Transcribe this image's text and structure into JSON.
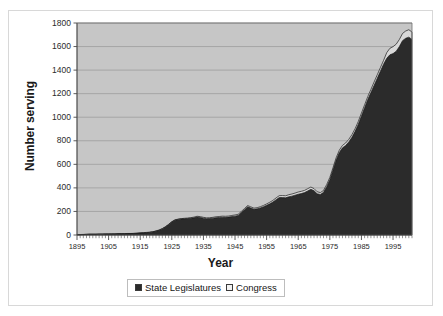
{
  "chart_data": {
    "type": "area",
    "title": "",
    "xlabel": "Year",
    "ylabel": "Number serving",
    "xlim": [
      1895,
      2001
    ],
    "ylim": [
      0,
      1800
    ],
    "ytick_labels": [
      "0",
      "200",
      "400",
      "600",
      "800",
      "1000",
      "1200",
      "1400",
      "1600",
      "1800"
    ],
    "ytick_values": [
      0,
      200,
      400,
      600,
      800,
      1000,
      1200,
      1400,
      1600,
      1800
    ],
    "xtick_labels": [
      "1895",
      "1905",
      "1915",
      "1925",
      "1935",
      "1945",
      "1955",
      "1965",
      "1975",
      "1985",
      "1995"
    ],
    "xtick_values": [
      1895,
      1905,
      1915,
      1925,
      1935,
      1945,
      1955,
      1965,
      1975,
      1985,
      1995
    ],
    "grid": "horizontal",
    "stacked": true,
    "legend_position": "bottom",
    "plot_background": "#c6c6c6",
    "x": [
      1895,
      1896,
      1897,
      1898,
      1899,
      1900,
      1901,
      1902,
      1903,
      1904,
      1905,
      1906,
      1907,
      1908,
      1909,
      1910,
      1911,
      1912,
      1913,
      1914,
      1915,
      1916,
      1917,
      1918,
      1919,
      1920,
      1921,
      1922,
      1923,
      1924,
      1925,
      1926,
      1927,
      1928,
      1929,
      1930,
      1931,
      1932,
      1933,
      1934,
      1935,
      1936,
      1937,
      1938,
      1939,
      1940,
      1941,
      1942,
      1943,
      1944,
      1945,
      1946,
      1947,
      1948,
      1949,
      1950,
      1951,
      1952,
      1953,
      1954,
      1955,
      1956,
      1957,
      1958,
      1959,
      1960,
      1961,
      1962,
      1963,
      1964,
      1965,
      1966,
      1967,
      1968,
      1969,
      1970,
      1971,
      1972,
      1973,
      1974,
      1975,
      1976,
      1977,
      1978,
      1979,
      1980,
      1981,
      1982,
      1983,
      1984,
      1985,
      1986,
      1987,
      1988,
      1989,
      1990,
      1991,
      1992,
      1993,
      1994,
      1995,
      1996,
      1997,
      1998,
      1999,
      2000,
      2001
    ],
    "series": [
      {
        "name": "State Legislatures",
        "color": "#2b2b2b",
        "values": [
          3,
          3,
          4,
          5,
          6,
          6,
          6,
          7,
          7,
          8,
          8,
          9,
          9,
          10,
          10,
          11,
          12,
          12,
          13,
          14,
          16,
          18,
          20,
          22,
          26,
          32,
          40,
          52,
          68,
          88,
          110,
          126,
          132,
          136,
          138,
          140,
          142,
          146,
          152,
          149,
          143,
          139,
          140,
          143,
          147,
          149,
          151,
          150,
          152,
          157,
          160,
          166,
          190,
          215,
          240,
          229,
          218,
          222,
          230,
          240,
          252,
          265,
          280,
          300,
          318,
          318,
          316,
          324,
          330,
          338,
          346,
          352,
          360,
          374,
          388,
          376,
          350,
          344,
          362,
          410,
          470,
          552,
          636,
          700,
          740,
          760,
          790,
          830,
          880,
          940,
          1010,
          1080,
          1150,
          1210,
          1270,
          1330,
          1390,
          1450,
          1500,
          1530,
          1540,
          1560,
          1600,
          1650,
          1670,
          1680,
          1660
        ]
      },
      {
        "name": "Congress",
        "color": "#d8d8d8",
        "values": [
          1,
          1,
          1,
          1,
          1,
          1,
          1,
          1,
          1,
          1,
          1,
          1,
          1,
          1,
          1,
          1,
          1,
          1,
          1,
          1,
          2,
          2,
          2,
          2,
          2,
          3,
          3,
          3,
          3,
          3,
          3,
          3,
          3,
          3,
          4,
          4,
          5,
          6,
          7,
          7,
          7,
          7,
          7,
          7,
          8,
          8,
          9,
          9,
          9,
          9,
          10,
          10,
          10,
          10,
          10,
          10,
          10,
          10,
          10,
          11,
          12,
          13,
          14,
          15,
          16,
          17,
          17,
          18,
          18,
          18,
          19,
          19,
          19,
          19,
          19,
          18,
          17,
          16,
          16,
          18,
          19,
          19,
          20,
          20,
          21,
          21,
          22,
          22,
          23,
          24,
          25,
          25,
          25,
          26,
          29,
          30,
          31,
          32,
          48,
          55,
          59,
          60,
          60,
          61,
          62,
          63,
          63
        ]
      }
    ]
  },
  "axes": {
    "y_title": "Number serving",
    "x_title": "Year"
  },
  "legend": {
    "items": [
      {
        "label": "State Legislatures",
        "color": "#2b2b2b"
      },
      {
        "label": "Congress",
        "color": "#f2f2f2"
      }
    ]
  }
}
